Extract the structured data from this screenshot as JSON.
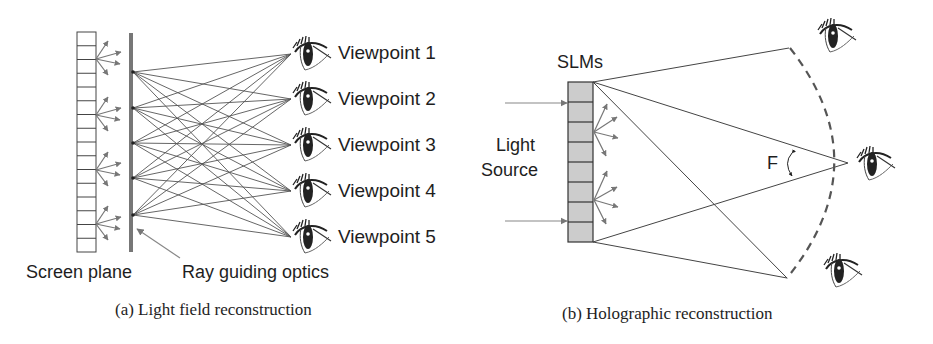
{
  "panel_a": {
    "caption": "(a)  Light field reconstruction",
    "screen_label": "Screen plane",
    "optics_label": "Ray guiding optics",
    "viewpoints": [
      "Viewpoint 1",
      "Viewpoint 2",
      "Viewpoint 3",
      "Viewpoint 4",
      "Viewpoint 5"
    ],
    "screen_cells": 16,
    "ray_sources": 5
  },
  "panel_b": {
    "caption": "(b)  Holographic reconstruction",
    "slm_label": "SLMs",
    "light_label_line1": "Light",
    "light_label_line2": "Source",
    "angle_label": "F",
    "slm_cells": 8,
    "eye_count": 3
  },
  "colors": {
    "line": "#555555",
    "arrow": "#777777",
    "slm_fill": "#cccccc",
    "text": "#1e1e1e"
  }
}
